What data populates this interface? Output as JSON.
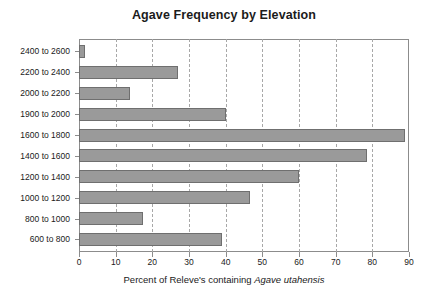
{
  "chart_data": {
    "type": "bar",
    "orientation": "horizontal",
    "title": "Agave Frequency by Elevation",
    "xlabel_parts": {
      "prefix": "Percent of Releve's containing ",
      "species": "Agave utahensis"
    },
    "xlabel": "Percent of Releve's containing Agave utahensis",
    "ylabel": "",
    "categories": [
      "2400 to 2600",
      "2200 to 2400",
      "2000 to 2200",
      "1900 to 2000",
      "1600 to 1800",
      "1400 to 1600",
      "1200 to 1400",
      "1000 to 1200",
      "800 to 1000",
      "600 to 800"
    ],
    "values": [
      1.5,
      27,
      14,
      40,
      89,
      78.5,
      60,
      46.5,
      17.5,
      39
    ],
    "xlim": [
      0,
      90
    ],
    "xticks": [
      0,
      10,
      20,
      30,
      40,
      50,
      60,
      70,
      80,
      90
    ],
    "xtick_labels": [
      "0",
      "10",
      "20",
      "30",
      "40",
      "50",
      "60",
      "70",
      "80",
      "90"
    ],
    "grid": "vertical-dashed",
    "legend": "none",
    "bar_color": "#9a9a9a",
    "bar_border_color": "#6f6f6f",
    "grid_color": "#a8a8a8",
    "frame_color": "#8c8c8c",
    "background": "#ffffff"
  }
}
